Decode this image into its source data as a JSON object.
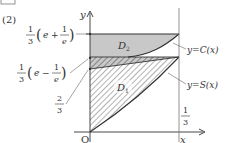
{
  "problem_label": "(2)",
  "axes": {
    "x_label": "x",
    "y_label": "y",
    "origin_label": "O"
  },
  "y_ticks": [
    {
      "name": "top",
      "numerator": "1",
      "denominator": "3",
      "paren_open": "(",
      "a": "e",
      "op": "+",
      "frac_num": "1",
      "frac_den": "e",
      "paren_close": ")"
    },
    {
      "name": "mid",
      "numerator": "1",
      "denominator": "3",
      "paren_open": "(",
      "a": "e",
      "op": "−",
      "frac_num": "1",
      "frac_den": "e",
      "paren_close": ")"
    },
    {
      "name": "low",
      "numerator": "2",
      "denominator": "3"
    }
  ],
  "x_tick": {
    "numerator": "1",
    "denominator": "3"
  },
  "curves": {
    "c_label": "y=C(x)",
    "s_label": "y=S(x)"
  },
  "regions": {
    "upper": {
      "letter": "D",
      "subscript": "2"
    },
    "lower": {
      "letter": "D",
      "subscript": "1"
    }
  },
  "colors": {
    "gray_fill": "#c8c8c8",
    "line": "#333333",
    "hatch": "#555555"
  }
}
